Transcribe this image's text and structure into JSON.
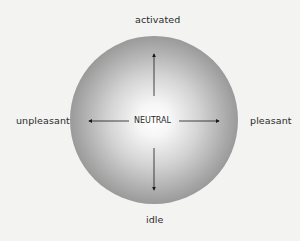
{
  "diagram": {
    "title": "",
    "center_label": "NEUTRAL",
    "poles": {
      "top": "activated",
      "bottom": "idle",
      "left": "unpleasant",
      "right": "pleasant"
    },
    "axes": [
      {
        "name": "arousal",
        "from": "idle",
        "to": "activated"
      },
      {
        "name": "valence",
        "from": "unpleasant",
        "to": "pleasant"
      }
    ],
    "colors": {
      "background": "#f3f3f1",
      "circle_center": "#ffffff",
      "circle_edge": "#6c6c6c",
      "arrows": "#1a1a1a",
      "text": "#2a2a2a"
    }
  }
}
